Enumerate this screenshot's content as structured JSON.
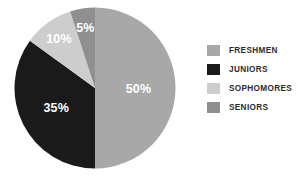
{
  "chart_data": {
    "type": "pie",
    "title": "",
    "subtitle": "",
    "xlabel": "",
    "ylabel": "",
    "legend_position": "right",
    "grid": false,
    "categories": [
      "FRESHMEN",
      "JUNIORS",
      "SOPHOMORES",
      "SENIORS"
    ],
    "values": [
      50,
      35,
      10,
      5
    ],
    "value_unit": "%",
    "slices": [
      {
        "label": "FRESHMEN",
        "value": 50,
        "data_label": "50%",
        "color": "#a8a8a8",
        "start_angle_deg": 0,
        "end_angle_deg": 180
      },
      {
        "label": "JUNIORS",
        "value": 35,
        "data_label": "35%",
        "color": "#1a1a1a",
        "start_angle_deg": 180,
        "end_angle_deg": 306
      },
      {
        "label": "SOPHOMORES",
        "value": 10,
        "data_label": "10%",
        "color": "#cdcdcd",
        "start_angle_deg": 306,
        "end_angle_deg": 342
      },
      {
        "label": "SENIORS",
        "value": 5,
        "data_label": "5%",
        "color": "#8f8f8f",
        "start_angle_deg": 342,
        "end_angle_deg": 360
      }
    ],
    "data_label_color": "#ffffff"
  },
  "legend": {
    "items": [
      {
        "label": "FRESHMEN",
        "color": "#a8a8a8"
      },
      {
        "label": "JUNIORS",
        "color": "#1a1a1a"
      },
      {
        "label": "SOPHOMORES",
        "color": "#cdcdcd"
      },
      {
        "label": "SENIORS",
        "color": "#8f8f8f"
      }
    ]
  },
  "labels": {
    "freshmen_pct": "50%",
    "juniors_pct": "35%",
    "sophomores_pct": "10%",
    "seniors_pct": "5%"
  },
  "colors": {
    "background": "#ffffff",
    "freshmen": "#a8a8a8",
    "juniors": "#1a1a1a",
    "sophomores": "#cdcdcd",
    "seniors": "#8f8f8f",
    "legend_text": "#2b2b2b",
    "data_label": "#ffffff"
  }
}
